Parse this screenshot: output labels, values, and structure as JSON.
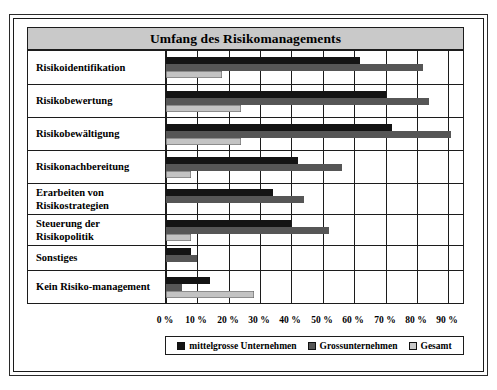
{
  "chart_data": {
    "type": "bar",
    "orientation": "horizontal",
    "title": "Umfang des Risikomanagements",
    "xlabel": "",
    "ylabel": "",
    "xlim": [
      0,
      95
    ],
    "grid": true,
    "legend_position": "bottom",
    "tick_labels": [
      "0 %",
      "10 %",
      "20 %",
      "30 %",
      "40 %",
      "50 %",
      "60 %",
      "70 %",
      "80 %",
      "90 %"
    ],
    "tick_values": [
      0,
      10,
      20,
      30,
      40,
      50,
      60,
      70,
      80,
      90
    ],
    "categories": [
      "Risikoidentifikation",
      "Risikobewertung",
      "Risikobewältigung",
      "Risikonachbereitung",
      "Erarbeiten von Risikostrategien",
      "Steuerung der Risikopolitik",
      "Sonstiges",
      "Kein Risiko-management"
    ],
    "series": [
      {
        "name": "mittelgrosse Unternehmen",
        "color": "#141414",
        "values": [
          62,
          70,
          72,
          42,
          34,
          40,
          8,
          14
        ]
      },
      {
        "name": "Grossunternehmen",
        "color": "#565656",
        "values": [
          82,
          84,
          91,
          56,
          44,
          52,
          10,
          5
        ]
      },
      {
        "name": "Gesamt",
        "color": "#c3c3c3",
        "values": [
          18,
          24,
          24,
          8,
          0,
          8,
          0,
          28
        ]
      }
    ]
  }
}
